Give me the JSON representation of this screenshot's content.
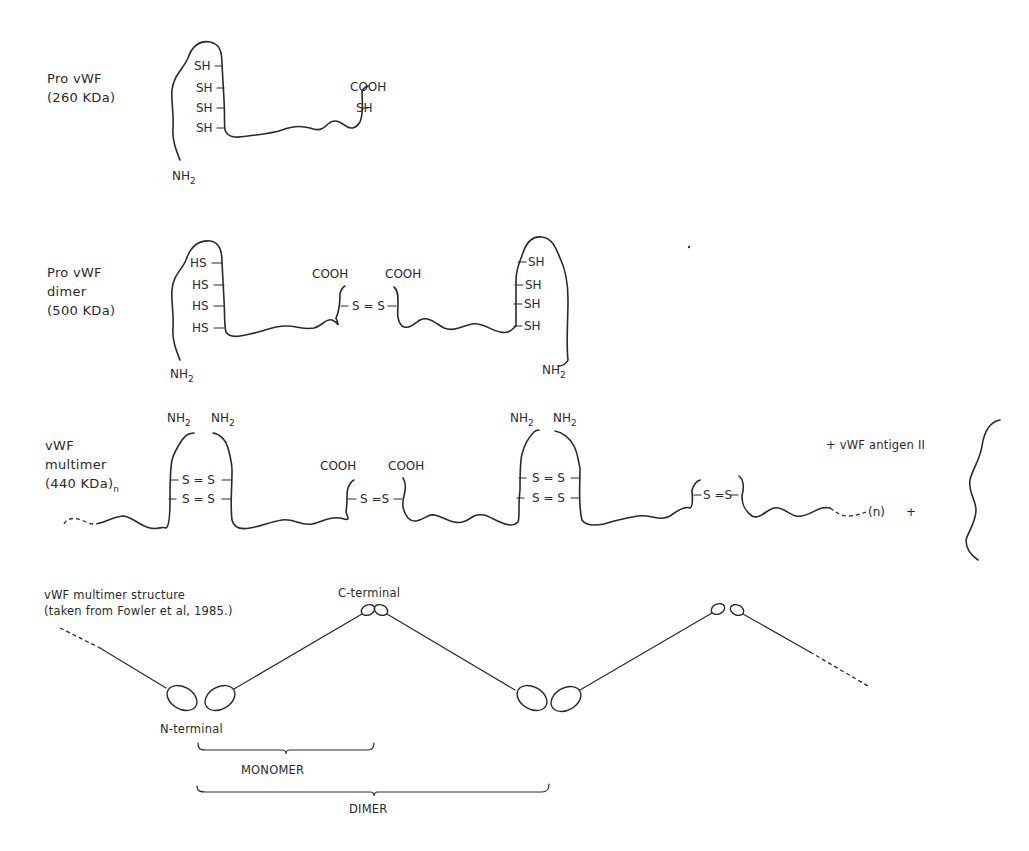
{
  "panels": {
    "pro_vwf": {
      "title_line1": "Pro vWF",
      "title_line2": "(260 KDa)",
      "sh_groups": [
        "SH",
        "SH",
        "SH",
        "SH"
      ],
      "cooh": "COOH",
      "c_sh": "SH",
      "nh2": "NH",
      "nh2_sub": "2"
    },
    "pro_vwf_dimer": {
      "title_line1": "Pro vWF",
      "title_line2": "dimer",
      "title_line3": "(500 KDa)",
      "left_groups": [
        "HS",
        "HS",
        "HS",
        "HS"
      ],
      "right_groups": [
        "SH",
        "SH",
        "SH",
        "SH"
      ],
      "cooh_left": "COOH",
      "cooh_right": "COOH",
      "disulfide": "S = S",
      "nh2_left": "NH",
      "nh2_right": "NH",
      "nh2_sub": "2"
    },
    "vwf_multimer": {
      "title_line1": "vWF",
      "title_line2": "multimer",
      "title_line3": "(440 KDa)",
      "title_sub": "n",
      "nh2": "NH",
      "nh2_sub": "2",
      "disulfide": "S = S",
      "disulfide_tight": "S =S",
      "cooh": "COOH",
      "repeat": "(n)",
      "plus": "+",
      "antigen": "+ vWF antigen II"
    },
    "multimer_structure": {
      "title_line1": "vWF multimer structure",
      "title_line2": "(taken from Fowler et al, 1985.)",
      "c_terminal": "C-terminal",
      "n_terminal": "N-terminal",
      "monomer": "MONOMER",
      "dimer": "DIMER"
    }
  }
}
